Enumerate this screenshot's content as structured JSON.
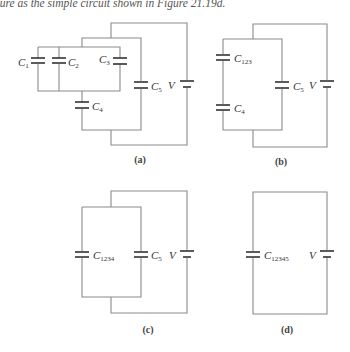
{
  "caption": "gure as the simple circuit shown in Figure 21.19d.",
  "circuits": {
    "a": {
      "panel_label": "(a)",
      "capacitors": [
        "C1",
        "C2",
        "C3",
        "C4",
        "C5"
      ],
      "labels": {
        "c1": "1",
        "c2": "2",
        "c3": "3",
        "c4": "4",
        "c5": "5"
      },
      "battery": "V"
    },
    "b": {
      "panel_label": "(b)",
      "capacitors": [
        "C123",
        "C4",
        "C5"
      ],
      "labels": {
        "c123": "123",
        "c4": "4",
        "c5": "5"
      },
      "battery": "V"
    },
    "c": {
      "panel_label": "(c)",
      "capacitors": [
        "C1234",
        "C5"
      ],
      "labels": {
        "c1234": "1234",
        "c5": "5"
      },
      "battery": "V"
    },
    "d": {
      "panel_label": "(d)",
      "capacitors": [
        "C12345"
      ],
      "labels": {
        "c12345": "12345"
      },
      "battery": "V"
    }
  },
  "symbols": {
    "capacitor_letter": "C",
    "capacitor-icon": "two parallel plates",
    "battery-icon": "long and short plate"
  },
  "colors": {
    "wire": "#8a8a8a",
    "plate": "#333333",
    "text": "#333333"
  }
}
